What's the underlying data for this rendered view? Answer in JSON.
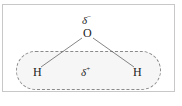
{
  "diagram": {
    "atoms": {
      "oxygen": "O",
      "hydrogen_left": "H",
      "hydrogen_right": "H"
    },
    "charges": {
      "oxygen_partial": {
        "symbol": "δ",
        "sign": "−"
      },
      "hydrogen_partial": {
        "symbol": "δ",
        "sign": "+"
      }
    },
    "colors": {
      "frame_border": "#c8c8c8",
      "pill_border": "#8a8a8a",
      "pill_fill": "#f6f6f6",
      "bond": "#666666",
      "text": "#222222"
    }
  }
}
